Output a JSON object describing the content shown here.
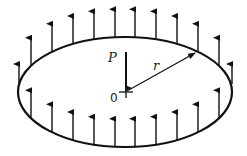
{
  "diagram": {
    "type": "ring load on circular plate",
    "labels": {
      "force": "P",
      "radius": "r",
      "origin": "0"
    },
    "colors": {
      "stroke": "#111111",
      "background": "#ffffff"
    },
    "ellipse": {
      "cx": 125,
      "cy": 92,
      "rx": 107,
      "ry": 55
    },
    "upper_arrows_x": [
      19,
      31,
      52,
      73,
      94,
      115,
      135,
      156,
      177,
      198,
      219,
      232
    ],
    "lower_arrows_x": [
      31,
      52,
      73,
      94,
      115,
      135,
      156,
      177,
      198,
      219
    ],
    "arrow_length": 28
  }
}
